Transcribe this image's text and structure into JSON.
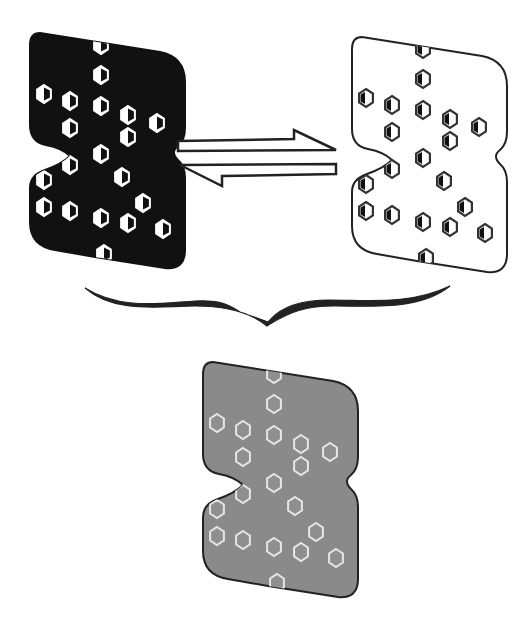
{
  "diagram": {
    "title": "Equilibrium between dark and light states averaging to an intermediate state",
    "panels": [
      {
        "id": "dark-state",
        "label": "Dark state",
        "fill": "#111111",
        "stroke": "#111111",
        "hex_fill": "#ffffff",
        "hex_stroke": "#ffffff",
        "hex_style": "half-filled-light",
        "offset": [
          0,
          0
        ]
      },
      {
        "id": "light-state",
        "label": "Light state",
        "fill": "#ffffff",
        "stroke": "#222222",
        "hex_fill": "#ffffff",
        "hex_stroke": "#333333",
        "hex_style": "half-filled-dark",
        "offset": [
          322,
          4
        ]
      },
      {
        "id": "averaged-state",
        "label": "Averaged state",
        "fill": "#8a8a8a",
        "stroke": "#222222",
        "hex_fill": "#8f8f8f",
        "hex_stroke": "#e6e6e6",
        "hex_style": "outline",
        "offset": [
          173,
          329
        ]
      }
    ],
    "hexagons": [
      [
        101,
        45
      ],
      [
        101,
        75
      ],
      [
        44,
        94
      ],
      [
        70,
        101
      ],
      [
        101,
        106
      ],
      [
        128,
        115
      ],
      [
        157,
        123
      ],
      [
        70,
        128
      ],
      [
        128,
        137
      ],
      [
        101,
        154
      ],
      [
        70,
        165
      ],
      [
        122,
        177
      ],
      [
        44,
        180
      ],
      [
        44,
        207
      ],
      [
        143,
        203
      ],
      [
        70,
        211
      ],
      [
        101,
        218
      ],
      [
        128,
        223
      ],
      [
        163,
        229
      ],
      [
        104,
        254
      ]
    ],
    "equilibrium_arrows": {
      "symbol": "⇌",
      "label": "Equilibrium",
      "color": "#222222"
    },
    "brace": {
      "label": "Average",
      "color": "#222222"
    }
  }
}
